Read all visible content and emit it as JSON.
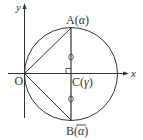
{
  "diagram": {
    "title": "",
    "colors": {
      "line": "#333333",
      "background": "#ffffff"
    },
    "axes": {
      "x_label": "x",
      "y_label": "y"
    },
    "points": {
      "origin": {
        "label": "O"
      },
      "A": {
        "label": "A(",
        "arg": "α",
        "close": ")"
      },
      "B": {
        "label": "B(",
        "arg": "α",
        "close": ")",
        "arg_overline": true
      },
      "C": {
        "label": "C(",
        "arg": "γ",
        "close": ")"
      }
    },
    "shapes": [
      {
        "type": "circle",
        "center": "C",
        "passes_through": [
          "O",
          "A",
          "B"
        ]
      },
      {
        "type": "segment",
        "from": "O",
        "to": "A"
      },
      {
        "type": "segment",
        "from": "O",
        "to": "B"
      },
      {
        "type": "segment",
        "from": "A",
        "to": "B"
      }
    ],
    "markers": {
      "right_angle_at": "C",
      "equal_length_ticks": [
        "AC",
        "CB"
      ]
    }
  }
}
